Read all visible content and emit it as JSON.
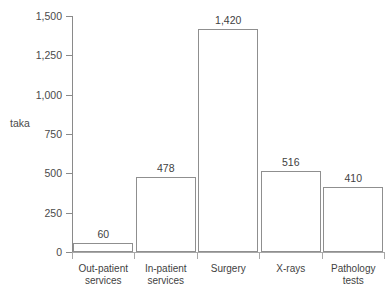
{
  "chart_data": {
    "type": "bar",
    "title": "",
    "subtitle": "",
    "xlabel": "",
    "ylabel": "taka",
    "categories": [
      "Out-patient services",
      "In-patient services",
      "Surgery",
      "X-rays",
      "Pathology tests"
    ],
    "category_lines": [
      [
        "Out-patient",
        "services"
      ],
      [
        "In-patient",
        "services"
      ],
      [
        "Surgery",
        ""
      ],
      [
        "X-rays",
        ""
      ],
      [
        "Pathology",
        "tests"
      ]
    ],
    "values": [
      60,
      478,
      1420,
      516,
      410
    ],
    "value_labels": [
      "60",
      "478",
      "1,420",
      "516",
      "410"
    ],
    "ylim": [
      0,
      1500
    ],
    "yticks": [
      0,
      250,
      500,
      750,
      1000,
      1250,
      1500
    ],
    "ytick_labels": [
      "0",
      "250",
      "500",
      "750",
      "1,000",
      "1,250",
      "1,500"
    ],
    "grid": false,
    "legend": false,
    "legend_position": "none",
    "bar_fill_color": "#ffffff",
    "bar_edge_color": "#8f8f8f",
    "axis_color": "#8a8a8a",
    "text_color": "#3f3f3f"
  },
  "caption": {
    "clipped_text": ""
  }
}
